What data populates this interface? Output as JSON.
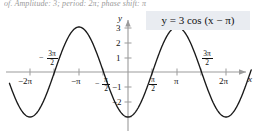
{
  "header": {
    "exercise_text": "of. Amplitude: 3; period: 2π; phase shift: π"
  },
  "equation": {
    "label": "y = 3 cos (x − π)",
    "box_color": "#e9ecf1"
  },
  "axes": {
    "x_axis_label": "x",
    "y_axis_label": "y",
    "axis_color": "#9b9b9b",
    "curve_color": "#1a1a1a",
    "x_tick_labels": [
      {
        "text": "−2π",
        "value": -6.2832
      },
      {
        "text": "−π",
        "value": -3.1416
      },
      {
        "text": "π",
        "value": 3.1416
      },
      {
        "text": "2π",
        "value": 6.2832
      }
    ],
    "x_fraction_labels": [
      {
        "lead": "−",
        "num": "3π",
        "den": "2",
        "value": -4.7124
      },
      {
        "lead": "−",
        "num": "π",
        "den": "2",
        "value": -1.5708
      },
      {
        "lead": "",
        "num": "π",
        "den": "2",
        "value": 1.5708
      },
      {
        "lead": "",
        "num": "3π",
        "den": "2",
        "value": 4.7124
      }
    ],
    "y_tick_labels": [
      {
        "text": "3",
        "value": 3
      },
      {
        "text": "2",
        "value": 2
      },
      {
        "text": "1",
        "value": 1
      },
      {
        "text": "−1",
        "value": -1
      },
      {
        "text": "−2",
        "value": -2
      }
    ]
  },
  "chart_data": {
    "type": "line",
    "title": "",
    "subtitle": "",
    "xlabel": "x",
    "ylabel": "y",
    "function": "y = 3 cos (x - π)",
    "amplitude": 3,
    "period": 6.2832,
    "phase_shift": 3.1416,
    "xlim": [
      -7.6,
      7.9
    ],
    "ylim": [
      -3.7,
      3.7
    ],
    "grid": false,
    "legend": "none",
    "x_ticks": [
      -6.2832,
      -4.7124,
      -3.1416,
      -1.5708,
      1.5708,
      3.1416,
      4.7124,
      6.2832
    ],
    "x_tick_text": [
      "-2π",
      "-3π/2",
      "-π",
      "-π/2",
      "π/2",
      "π",
      "3π/2",
      "2π"
    ],
    "y_ticks": [
      3,
      2,
      1,
      -1,
      -2
    ],
    "y_tick_text": [
      "3",
      "2",
      "1",
      "-1",
      "-2"
    ],
    "key_points": [
      {
        "x": -6.2832,
        "y": -3.0,
        "kind": "minimum"
      },
      {
        "x": -4.7124,
        "y": 0.0,
        "kind": "zero"
      },
      {
        "x": -3.1416,
        "y": 3.0,
        "kind": "maximum"
      },
      {
        "x": -1.5708,
        "y": 0.0,
        "kind": "zero"
      },
      {
        "x": 0.0,
        "y": -3.0,
        "kind": "minimum"
      },
      {
        "x": 1.5708,
        "y": 0.0,
        "kind": "zero"
      },
      {
        "x": 3.1416,
        "y": 3.0,
        "kind": "maximum"
      },
      {
        "x": 4.7124,
        "y": 0.0,
        "kind": "zero"
      },
      {
        "x": 6.2832,
        "y": -3.0,
        "kind": "minimum"
      }
    ],
    "series": [
      {
        "name": "y = 3 cos (x - π)",
        "x": [
          -7.6,
          -7.2,
          -6.8,
          -6.4,
          -6.0,
          -5.6,
          -5.2,
          -4.8,
          -4.4,
          -4.0,
          -3.6,
          -3.2,
          -2.8,
          -2.4,
          -2.0,
          -1.6,
          -1.2,
          -0.8,
          -0.4,
          0.0,
          0.4,
          0.8,
          1.2,
          1.6,
          2.0,
          2.4,
          2.8,
          3.2,
          3.6,
          4.0,
          4.4,
          4.8,
          5.2,
          5.6,
          6.0,
          6.4,
          6.8,
          7.2,
          7.6
        ],
        "values": [
          -2.22,
          -2.72,
          -2.96,
          -2.95,
          -2.69,
          -2.2,
          -1.52,
          -0.71,
          0.17,
          1.04,
          1.81,
          2.4,
          2.81,
          2.99,
          2.92,
          2.62,
          2.08,
          1.36,
          0.54,
          -0.3,
          -1.11,
          -1.82,
          -2.41,
          -2.82,
          -2.99,
          -2.92,
          -2.63,
          -2.08,
          -1.36,
          -0.55,
          0.3,
          1.11,
          1.82,
          2.41,
          2.82,
          2.99,
          2.92,
          2.63,
          2.08
        ]
      }
    ]
  }
}
